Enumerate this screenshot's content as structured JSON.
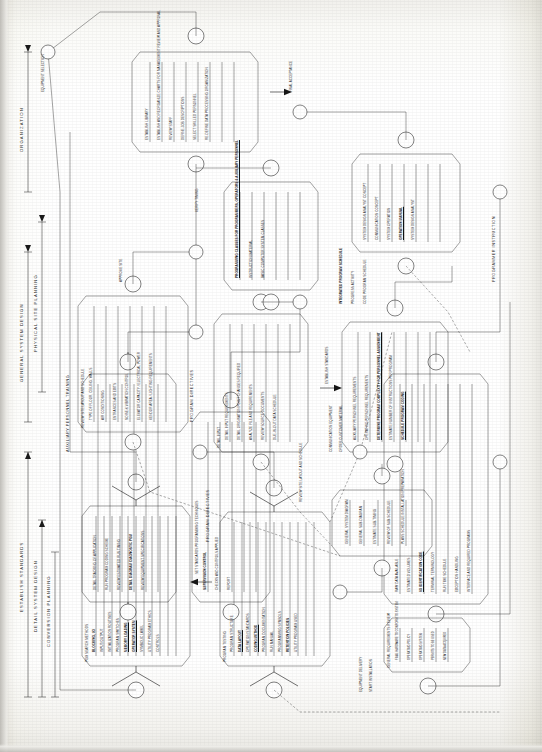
{
  "document": {
    "kind": "engineering-network-diagram",
    "orientation": "rotated-90-ccw",
    "title": "System Implementation Planning Network",
    "ink_color": "#262626",
    "paper_color": "#ffffff"
  },
  "phase_bands": [
    {
      "id": "establish-standards",
      "label": "ESTABLISH STANDARDS"
    },
    {
      "id": "detail-system-design",
      "label": "DETAIL SYSTEM DESIGN"
    },
    {
      "id": "conversion-planning",
      "label": "CONVERSION PLANNING"
    },
    {
      "id": "general-system-design",
      "label": "GENERAL SYSTEM DESIGN"
    },
    {
      "id": "physical-site-planning",
      "label": "PHYSICAL SITE PLANNING"
    },
    {
      "id": "organization",
      "label": "ORGANIZATION"
    }
  ],
  "stream_labels": [
    {
      "id": "auxiliary-personnel-training",
      "label": "AUXILIARY PERSONNEL TRAINING"
    },
    {
      "id": "program-directives-1",
      "label": "PROGRAM DIRECTIVES"
    },
    {
      "id": "program-directives-2",
      "label": "PROGRAM DIRECTIVES"
    },
    {
      "id": "programmer-instruction",
      "label": "PROGRAMMER INSTRUCTION"
    },
    {
      "id": "set-standards",
      "label": "SET STANDARDS PROGRAMMING TECHNIQUES"
    },
    {
      "id": "establish-std",
      "label": "ESTABLISH STANDARDS"
    },
    {
      "id": "equipment-selection",
      "label": "EQUIPMENT SELECTION"
    }
  ],
  "clusters": [
    {
      "id": "program-search-methods",
      "heading": "PGM SEARCH METHODS",
      "items": [
        {
          "label": "BLOCKING, I/O",
          "bold": true
        },
        {
          "label": "INPUT/OUTPUT",
          "bold": false
        },
        {
          "label": "INITIALIZATION ROUTINES",
          "bold": false
        },
        {
          "label": "PROGRAM SWITCHES",
          "bold": false
        },
        {
          "label": "MEMORY LOADING",
          "bold": true
        },
        {
          "label": "OPERATOR SYSTEM",
          "bold": true
        },
        {
          "label": "SYMBOLIC LABEL",
          "bold": false
        },
        {
          "label": "UTILITY PROGRAM ETHICS",
          "bold": false
        },
        {
          "label": "CONTROLS",
          "bold": false
        }
      ]
    },
    {
      "id": "program-testing",
      "heading": "PROGRAM TESTING",
      "items": [
        {
          "label": "PROGRAM STRUCTURE",
          "bold": false
        },
        {
          "label": "DATA LAYOUT",
          "bold": true
        },
        {
          "label": "OPERATION STANDARDS",
          "bold": false
        },
        {
          "label": "CODING METHOD",
          "bold": true
        },
        {
          "label": "PROGRAM DOCUMENTATION",
          "bold": false
        },
        {
          "label": "RUN MANUAL",
          "bold": false
        },
        {
          "label": "PROGRAMMING SYMBOLS",
          "bold": false
        },
        {
          "label": "RETENTION POLICIES",
          "bold": true
        },
        {
          "label": "UTILITY PROGRAM USED",
          "bold": false
        }
      ]
    },
    {
      "id": "detail-design-application",
      "heading": "DETAIL DESIGN",
      "items": [
        {
          "label": "DETAIL TRACKING OF APPLICATION",
          "bold": false
        },
        {
          "label": "RUN PROGRAM CODING SCHEME",
          "bold": false
        },
        {
          "label": "REVIEW ESTIMATED RUN TIMING",
          "bold": false
        },
        {
          "label": "DETAIL DIAGRAM DIAGNOSTIC PGM",
          "bold": true
        },
        {
          "label": "REVIEW EQUIPMENT SPECIFICATIONS",
          "bold": false
        }
      ]
    },
    {
      "id": "supervision-control",
      "heading": "SUPERVISION CONTROL",
      "items": [
        {
          "label": "SUPERVISION CONTROL",
          "bold": true
        },
        {
          "label": "CHECKS AND CONTROLS APPLIED",
          "bold": false
        },
        {
          "label": "REPORT",
          "bold": false
        }
      ]
    },
    {
      "id": "input-specification",
      "heading": "INPUT SPECIFICATION",
      "items": [
        {
          "label": "RAW DATA AVAILABLE",
          "bold": false
        },
        {
          "label": "ESTIMATED VOLUMES",
          "bold": false
        },
        {
          "label": "I/O IDENTIFICATION CODE",
          "bold": true
        },
        {
          "label": "TERMINAL TERMINOLOGY",
          "bold": false
        },
        {
          "label": "RUN TIME SCHEDULE",
          "bold": false
        },
        {
          "label": "EXCEPTION HANDLING",
          "bold": false
        },
        {
          "label": "INTERFACE AND REQUIRED PROGRAMS",
          "bold": false
        }
      ]
    },
    {
      "id": "general-requirements-review",
      "heading": "GENERAL REQUIREMENTS REVIEW",
      "items": [
        {
          "label": "FINAL HARDWARE TO CONFORM TO SYSTEM",
          "bold": false
        },
        {
          "label": "OPERATING POLICY",
          "bold": false
        },
        {
          "label": "OPERATING SYSTEM",
          "bold": false
        },
        {
          "label": "PERMITS TO BE USED",
          "bold": false
        },
        {
          "label": "NEW DATA ACQUIRED",
          "bold": false
        }
      ]
    },
    {
      "id": "site-layout",
      "heading": "REVIEW SITE LAYOUT AND SCHEDULE",
      "items": [
        {
          "label": "TYPE OF FLOOR, CEILING, WALLS",
          "bold": false
        },
        {
          "label": "AIR CONDITIONING",
          "bold": false
        },
        {
          "label": "ENTRANCES AND EXITS",
          "bold": false
        },
        {
          "label": "NOISE & VIBRATION CONTROL",
          "bold": false
        },
        {
          "label": "ELEVATOR CAPACITY / ELECTRICAL POWER",
          "bold": false
        },
        {
          "label": "VENDOR AREA / LIGHTING REQUIREMENTS",
          "bold": false
        }
      ]
    },
    {
      "id": "input-requirements",
      "heading": "DETAIL INPUT",
      "items": [
        {
          "label": "DETAIL INPUT REQUIREMENTS",
          "bold": false
        },
        {
          "label": "DETAIL ORIGINATION POINT CHANGES REQUIRED",
          "bold": false
        },
        {
          "label": "ANALYZE FILE AND REQUIREMENTS",
          "bold": false
        },
        {
          "label": "REVIEW SOURCE DOCUMENTS",
          "bold": false
        },
        {
          "label": "DUE-IN-OUT DATA SCHEDULE",
          "bold": false
        }
      ]
    },
    {
      "id": "personnel-requirements",
      "heading": "PERSONNEL REQUIREMENTS",
      "items": [
        {
          "label": "AUXILIARY PERSONNEL REQUIREMENTS",
          "bold": false
        },
        {
          "label": "OPERATING PERSONNEL REQUIREMENTS",
          "bold": false
        },
        {
          "label": "DETERMINE PROGRAM COMPLEXITY FOR PERSONNEL ASSIGNMENT",
          "bold": true
        },
        {
          "label": "ESTIMATE NUMBER OF INSTRUCTIONS PER PROGRAM",
          "bold": false
        },
        {
          "label": "SCHEDULE PROGRAM CODING",
          "bold": true
        }
      ]
    },
    {
      "id": "integrated-schedule",
      "heading": "INTEGRATED PROGRAM SCHEDULE",
      "items": [
        {
          "label": "INTEGRATED PROGRAM SCHEDULE",
          "bold": true
        },
        {
          "label": "PROGRESS ACTIVITY",
          "bold": false
        },
        {
          "label": "CODE PROGRAM SCHEDULE",
          "bold": false
        }
      ]
    },
    {
      "id": "programming-classes",
      "heading": "INSTRUCTION MATERIAL",
      "items": [
        {
          "label": "PROGRAMMING CLASSES FOR PROGRAMMERS, OPERATORS & AUXILIARY PERSONNEL",
          "bold": true
        },
        {
          "label": "INSTRUCTION MATERIAL",
          "bold": false
        },
        {
          "label": "BASIC COMPUTER SYSTEM CLASSES",
          "bold": false
        }
      ]
    },
    {
      "id": "system-operation",
      "heading": "SYSTEM OPERATION",
      "items": [
        {
          "label": "SYSTEM DESIGN ANALYST CONCEPT",
          "bold": false
        },
        {
          "label": "COMMUNICATION CONCEPT",
          "bold": false
        },
        {
          "label": "SYSTEM OPERATION",
          "bold": false
        },
        {
          "label": "OPERATION MANUAL",
          "bold": true
        },
        {
          "label": "SYSTEM DESIGN ANALYST",
          "bold": false
        }
      ]
    },
    {
      "id": "organization-cluster",
      "heading": "ORGANIZATION PLANNING",
      "items": [
        {
          "label": "ESTABLISH LIBRARY",
          "bold": false
        },
        {
          "label": "ESTABLISH AND REORGANIZE CHARTS FOR MANAGEMENT REVIEW AND APPROVAL",
          "bold": false
        },
        {
          "label": "REVIEW STAFF",
          "bold": false
        },
        {
          "label": "DEFINE JOB DESCRIPTIONS",
          "bold": false
        },
        {
          "label": "SELECT SKILLED PERSONNEL",
          "bold": false
        },
        {
          "label": "RE-DEFINE DATA PROCESSING ORGANIZATION",
          "bold": false
        }
      ]
    },
    {
      "id": "diagram-cluster",
      "heading": "GENERAL SYSTEM DIAGRAM",
      "items": [
        {
          "label": "GENERAL SYSTEM DIAGRAM",
          "bold": false
        },
        {
          "label": "GENERAL SUB-DIAGRAM",
          "bold": false
        },
        {
          "label": "ESTIMATE SUB-TIMING",
          "bold": false
        },
        {
          "label": "REVIEW OF SUB-SCHEDULE",
          "bold": false
        },
        {
          "label": "PLANS SCHEDULE INSTALLATION PREPARATION",
          "bold": false
        }
      ]
    }
  ],
  "misc_labels": [
    {
      "id": "communication-equipment",
      "label": "COMMUNICATION EQUIPMENT"
    },
    {
      "id": "order-customer-material",
      "label": "ORDER CUSTOMER MATERIAL"
    },
    {
      "id": "equipment-delivery",
      "label": "EQUIPMENT DELIVERY"
    },
    {
      "id": "start-installation",
      "label": "START INSTALLATION"
    },
    {
      "id": "final-acceptance",
      "label": "FINAL ACCEPTANCE"
    },
    {
      "id": "approve-site",
      "label": "APPROVE SITE"
    },
    {
      "id": "review-site-layout",
      "label": "REVIEW SITE LAYOUT AND SCHEDULE"
    },
    {
      "id": "verify-timing",
      "label": "VERIFY TIMING"
    }
  ]
}
